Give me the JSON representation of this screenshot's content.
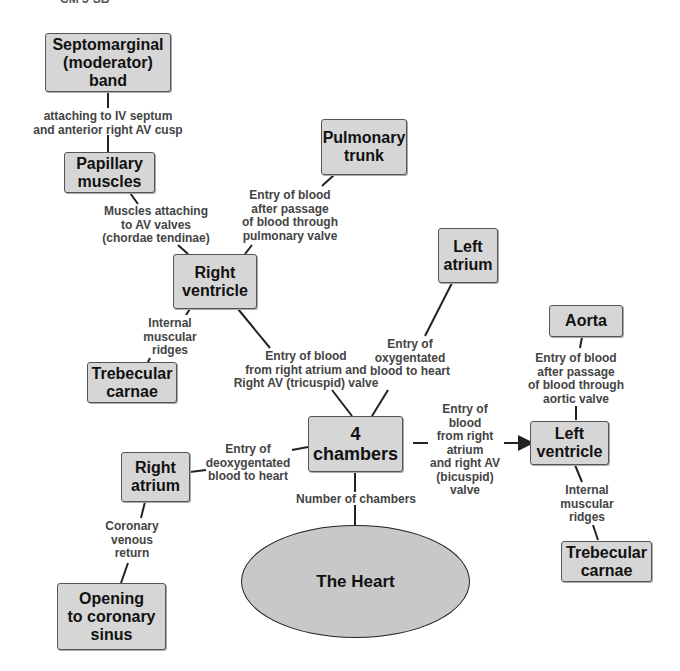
{
  "header": {
    "cut_text": "CM 3-SB"
  },
  "colors": {
    "box_fill": "#d6d6d6",
    "ellipse_fill": "#c8c8c8",
    "line": "#222222",
    "label_text": "#444444"
  },
  "nodes": {
    "heart": "The Heart",
    "chambers": "4\nchambers",
    "right_ventricle": "Right\nventricle",
    "right_atrium": "Right\natrium",
    "left_atrium": "Left\natrium",
    "left_ventricle": "Left\nventricle",
    "pulmonary_trunk": "Pulmonary\ntrunk",
    "aorta": "Aorta",
    "papillary": "Papillary\nmuscles",
    "septomarginal": "Septomarginal\n(moderator)\nband",
    "trabecular_right": "Trebecular\ncarnae",
    "trabecular_left": "Trebecular\ncarnae",
    "coronary_sinus": "Opening\nto coronary\nsinus"
  },
  "links": {
    "number_of_chambers": "Number of chambers",
    "deoxy": "Entry of\ndeoxygentated\nblood to heart",
    "oxy": "Entry of\noxygentated\nblood to heart",
    "tricuspid": "Entry of blood\nfrom right atrium and\nRight AV (tricuspid) valve",
    "bicuspid": "Entry of\nblood\nfrom right\natrium\nand right AV\n(bicuspid)\nvalve",
    "pulmonary": "Entry of blood\nafter passage\nof blood through\npulmonary valve",
    "aortic": "Entry of blood\nafter passage\nof blood through\naortic valve",
    "chordae": "Muscles attaching\nto AV valves\n(chordae tendinae)",
    "septum": "attaching to IV septum\nand anterior right AV cusp",
    "ridges_right": "Internal\nmuscular\nridges",
    "ridges_left": "Internal\nmuscular\nridges",
    "coronary_return": "Coronary\nvenous\nreturn"
  }
}
